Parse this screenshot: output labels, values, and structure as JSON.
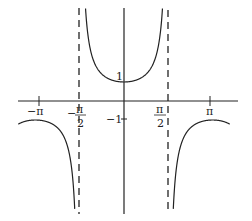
{
  "chart_data": {
    "type": "line",
    "title": "",
    "function": "y = sec(x)",
    "xlabel": "",
    "ylabel": "",
    "xlim": [
      -3.8,
      4.0
    ],
    "ylim": [
      -6.3,
      5.6
    ],
    "grid": false,
    "legend": null,
    "x_ticks": [
      {
        "value": -3.14159,
        "label": "−π"
      },
      {
        "value": -1.5708,
        "label": "−π/2"
      },
      {
        "value": 1.5708,
        "label": "π/2"
      },
      {
        "value": 3.14159,
        "label": "π"
      }
    ],
    "y_ticks": [
      {
        "value": 1,
        "label": "1"
      },
      {
        "value": -1,
        "label": "−1"
      }
    ],
    "asymptotes": [
      {
        "x": -1.5708,
        "style": "dashed"
      },
      {
        "x": 1.5708,
        "style": "dashed"
      }
    ],
    "series": [
      {
        "name": "sec(x) middle branch",
        "x": [
          -1.4,
          -1.2,
          -0.8,
          -0.4,
          0,
          0.4,
          0.8,
          1.2,
          1.4
        ],
        "values": [
          5.9,
          2.76,
          1.44,
          1.09,
          1.0,
          1.09,
          1.44,
          2.76,
          5.9
        ]
      },
      {
        "name": "sec(x) left branch",
        "x": [
          -3.8,
          -3.14159,
          -2.5,
          -2.0,
          -1.75
        ],
        "values": [
          -1.26,
          -1.0,
          -1.25,
          -2.4,
          -5.6
        ]
      },
      {
        "name": "sec(x) right branch",
        "x": [
          1.75,
          2.0,
          2.5,
          3.14159,
          3.8
        ],
        "values": [
          -5.6,
          -2.4,
          -1.25,
          -1.0,
          -1.26
        ]
      }
    ]
  },
  "labels": {
    "neg_pi": "−π",
    "neg_pi_half_num": "π",
    "neg_pi_half_den": "2",
    "neg_sign": "−",
    "pi_half_num": "π",
    "pi_half_den": "2",
    "pi": "π",
    "one": "1",
    "neg_one": "−1"
  }
}
